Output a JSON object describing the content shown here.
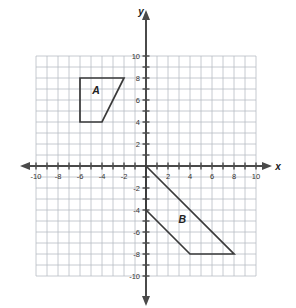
{
  "chart_data": {
    "type": "scatter",
    "title": "",
    "xlabel": "x",
    "ylabel": "y",
    "xlim": [
      -10,
      10
    ],
    "ylim": [
      -10,
      10
    ],
    "grid": true,
    "grid_step": 1,
    "tick_step": 2,
    "legend": "none",
    "x_tick_labels": [
      "-10",
      "-8",
      "-6",
      "-4",
      "-2",
      "2",
      "4",
      "6",
      "8",
      "10"
    ],
    "x_tick_values": [
      -10,
      -8,
      -6,
      -4,
      -2,
      2,
      4,
      6,
      8,
      10
    ],
    "y_tick_labels": [
      "10",
      "8",
      "6",
      "4",
      "2",
      "-2",
      "-4",
      "-6",
      "-8",
      "-10"
    ],
    "y_tick_values": [
      10,
      8,
      6,
      4,
      2,
      -2,
      -4,
      -6,
      -8,
      -10
    ],
    "shapes": [
      {
        "name": "A",
        "label": "A",
        "label_position": [
          -4.55,
          6.55
        ],
        "kind": "parallelogram",
        "vertices": [
          [
            -6,
            8
          ],
          [
            -2,
            8
          ],
          [
            -4,
            4
          ],
          [
            -6,
            4
          ]
        ],
        "polygon_points": "-6,8 -2,8 -4,4 -6,4"
      },
      {
        "name": "B",
        "label": "B",
        "label_position": [
          3.3,
          -5.2
        ],
        "kind": "parallelogram",
        "vertices": [
          [
            0,
            0
          ],
          [
            8,
            -8
          ],
          [
            4,
            -8
          ],
          [
            0,
            -4
          ]
        ],
        "polygon_points": "0,0 8,-8 4,-8 0,-4"
      }
    ]
  },
  "axes": {
    "x_axis_label": "x",
    "y_axis_label": "y"
  },
  "colors": {
    "background": "#ffffff",
    "grid": "#b8bcc4",
    "axis": "#4a4a4a",
    "shape_stroke": "#3a3a3a",
    "label_text": "#222222",
    "tick_text": "#333333"
  }
}
